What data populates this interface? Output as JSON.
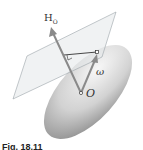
{
  "figure": {
    "labels": {
      "angular_momentum": "H",
      "angular_momentum_sub": "O",
      "angular_velocity": "ω",
      "origin": "O"
    },
    "caption": "Fig. 18.11",
    "colors": {
      "ellipsoid_light": "#f2f2f2",
      "ellipsoid_dark": "#9a9a9a",
      "plane_fill": "#e4e8ea",
      "plane_edge": "#9aa3a8",
      "vector": "#8a8a8a",
      "line": "#333333"
    }
  }
}
